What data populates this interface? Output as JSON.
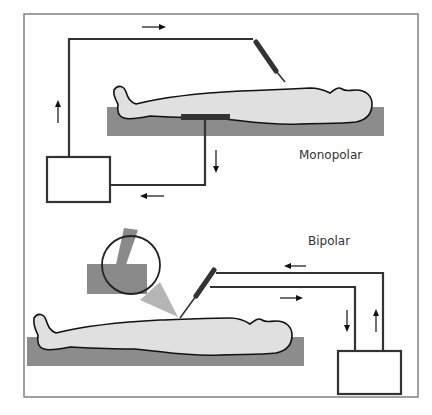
{
  "figure": {
    "monopolar_label": "Monopolar",
    "bipolar_label": "Bipolar"
  },
  "colors": {
    "frame": "#808080",
    "wire": "#333333",
    "table": "#8c8c8c",
    "body_fill": "#e0e0e0",
    "body_outline": "#111111",
    "inset_gray": "#8a8a8a",
    "inset_light": "#b5b5b5"
  }
}
